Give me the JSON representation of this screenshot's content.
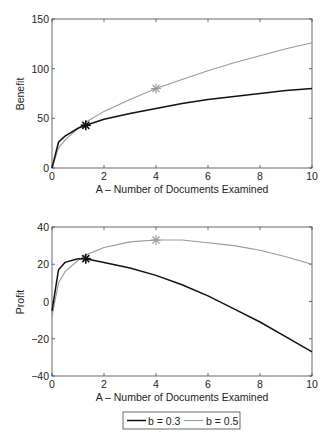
{
  "chart_data": [
    {
      "type": "line",
      "title": "",
      "xlabel": "A – Number of Documents Examined",
      "ylabel": "Benefit",
      "xlim": [
        0,
        10
      ],
      "ylim": [
        0,
        150
      ],
      "xticks": [
        0,
        2,
        4,
        6,
        8,
        10
      ],
      "yticks": [
        0,
        50,
        100,
        150
      ],
      "grid": false,
      "series": [
        {
          "name": "b = 0.3",
          "color": "#111111",
          "x": [
            0,
            0.25,
            0.5,
            1,
            1.3,
            2,
            3,
            4,
            5,
            6,
            7,
            8,
            9,
            10
          ],
          "y": [
            0,
            26,
            32,
            40,
            43,
            49,
            55,
            60,
            65,
            69,
            72,
            75,
            78,
            80
          ],
          "marker": {
            "x": 1.3,
            "y": 43
          }
        },
        {
          "name": "b = 0.5",
          "color": "#999999",
          "x": [
            0,
            0.25,
            0.5,
            1,
            1.3,
            2,
            3,
            4,
            5,
            6,
            7,
            8,
            9,
            10
          ],
          "y": [
            0,
            20,
            28,
            40,
            46,
            57,
            69,
            80,
            89,
            98,
            106,
            113,
            120,
            126
          ],
          "marker": {
            "x": 4,
            "y": 80
          }
        }
      ]
    },
    {
      "type": "line",
      "title": "",
      "xlabel": "A – Number of Documents Examined",
      "ylabel": "Profit",
      "xlim": [
        0,
        10
      ],
      "ylim": [
        -40,
        40
      ],
      "xticks": [
        0,
        2,
        4,
        6,
        8,
        10
      ],
      "yticks": [
        -40,
        -20,
        0,
        20,
        40
      ],
      "grid": false,
      "series": [
        {
          "name": "b = 0.3",
          "color": "#111111",
          "x": [
            0,
            0.25,
            0.5,
            1,
            1.3,
            2,
            3,
            4,
            5,
            6,
            7,
            8,
            9,
            10
          ],
          "y": [
            -5,
            17,
            21,
            23,
            23,
            21,
            18,
            14,
            9,
            3,
            -4,
            -11,
            -19,
            -27
          ],
          "marker": {
            "x": 1.3,
            "y": 23
          }
        },
        {
          "name": "b = 0.5",
          "color": "#999999",
          "x": [
            0,
            0.25,
            0.5,
            1,
            1.3,
            2,
            3,
            4,
            5,
            6,
            7,
            8,
            9,
            10
          ],
          "y": [
            -8,
            10,
            16,
            22,
            25,
            29,
            32,
            33,
            33,
            31.5,
            30,
            27.5,
            24,
            20
          ],
          "marker": {
            "x": 4,
            "y": 33
          }
        }
      ]
    }
  ],
  "legend": {
    "items": [
      {
        "label": "b = 0.3",
        "color": "#111111"
      },
      {
        "label": "b = 0.5",
        "color": "#999999"
      }
    ],
    "position": "bottom-center"
  },
  "plots": [
    {
      "ylabel": "Benefit",
      "xlabel": "A – Number of Documents Examined",
      "xtick_labels": [
        "0",
        "2",
        "4",
        "6",
        "8",
        "10"
      ],
      "ytick_labels": [
        "0",
        "50",
        "100",
        "150"
      ]
    },
    {
      "ylabel": "Profit",
      "xlabel": "A – Number of Documents Examined",
      "xtick_labels": [
        "0",
        "2",
        "4",
        "6",
        "8",
        "10"
      ],
      "ytick_labels": [
        "−40",
        "−20",
        "0",
        "20",
        "40"
      ]
    }
  ]
}
